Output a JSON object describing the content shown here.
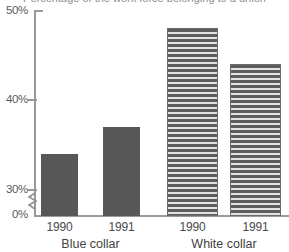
{
  "title_remnant": "cropped chart title (descender only)",
  "chart_data": {
    "type": "bar",
    "title": "",
    "xlabel": "",
    "ylabel": "",
    "ylim": [
      30,
      50
    ],
    "y_axis_break": true,
    "y_axis_break_note": "axis broken between 0% and 30%",
    "grid": false,
    "legend": "none",
    "ytick_labels": [
      "50%",
      "40%",
      "30%",
      "0%"
    ],
    "ytick_values": [
      50,
      40,
      30,
      0
    ],
    "groups": [
      {
        "name": "Blue collar",
        "fill": "solid",
        "bars": [
          {
            "label": "1990",
            "value": 34
          },
          {
            "label": "1991",
            "value": 37
          }
        ]
      },
      {
        "name": "White collar",
        "fill": "horizontal-stripes",
        "bars": [
          {
            "label": "1990",
            "value": 48
          },
          {
            "label": "1991",
            "value": 44
          }
        ]
      }
    ],
    "categories": [
      "Blue collar 1990",
      "Blue collar 1991",
      "White collar 1990",
      "White collar 1991"
    ],
    "values": [
      34,
      37,
      48,
      44
    ],
    "colors": {
      "bar_solid": "#575757",
      "bar_stripe_dark": "#5d5d5d",
      "bar_stripe_light": "#e3e3e3",
      "axis": "#9a9a9a",
      "text": "#4a4a4a",
      "background": "#ffffff"
    }
  }
}
